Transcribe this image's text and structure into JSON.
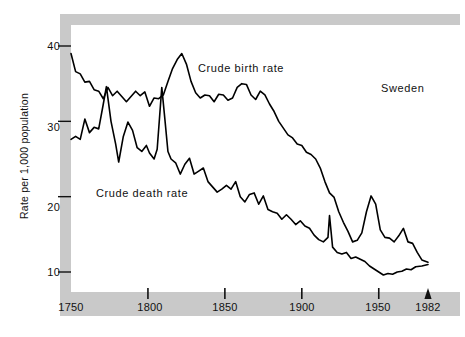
{
  "chart_data": {
    "type": "line",
    "title": "",
    "subtitle": "",
    "xlabel": "",
    "ylabel": "Rate per 1,000 population",
    "region_annotation": "Sweden",
    "xlim": [
      1750,
      1982
    ],
    "ylim": [
      8,
      42
    ],
    "grid": false,
    "legend_position": "inline-annotations",
    "x_ticks": [
      1750,
      1800,
      1850,
      1900,
      1950,
      1982
    ],
    "x_tick_labels": [
      "1750",
      "1800",
      "1850",
      "1900",
      "1950",
      "1982"
    ],
    "y_ticks": [
      10,
      20,
      30,
      40
    ],
    "y_tick_labels": [
      "10",
      "20",
      "30",
      "40"
    ],
    "end_marker": {
      "x": 1982,
      "shape": "up-arrow",
      "label": "1982"
    },
    "series": [
      {
        "name": "Crude birth rate",
        "label": "Crude birth rate",
        "color": "#000000",
        "points": [
          [
            1750,
            39.0
          ],
          [
            1753,
            36.6
          ],
          [
            1756,
            36.3
          ],
          [
            1759,
            35.2
          ],
          [
            1762,
            35.3
          ],
          [
            1765,
            34.2
          ],
          [
            1768,
            34.0
          ],
          [
            1771,
            33.0
          ],
          [
            1774,
            34.5
          ],
          [
            1777,
            33.4
          ],
          [
            1780,
            34.0
          ],
          [
            1783,
            33.3
          ],
          [
            1786,
            32.6
          ],
          [
            1789,
            33.3
          ],
          [
            1792,
            34.0
          ],
          [
            1795,
            33.4
          ],
          [
            1798,
            33.9
          ],
          [
            1801,
            32.0
          ],
          [
            1804,
            33.1
          ],
          [
            1807,
            33.0
          ],
          [
            1810,
            33.5
          ],
          [
            1813,
            35.3
          ],
          [
            1816,
            37.0
          ],
          [
            1819,
            38.2
          ],
          [
            1822,
            39.0
          ],
          [
            1825,
            37.6
          ],
          [
            1828,
            35.3
          ],
          [
            1831,
            33.8
          ],
          [
            1834,
            33.1
          ],
          [
            1837,
            33.5
          ],
          [
            1840,
            33.4
          ],
          [
            1843,
            32.6
          ],
          [
            1846,
            33.6
          ],
          [
            1849,
            33.5
          ],
          [
            1852,
            32.8
          ],
          [
            1855,
            33.1
          ],
          [
            1858,
            34.5
          ],
          [
            1861,
            35.0
          ],
          [
            1864,
            34.9
          ],
          [
            1867,
            33.5
          ],
          [
            1870,
            32.9
          ],
          [
            1873,
            34.0
          ],
          [
            1876,
            33.5
          ],
          [
            1879,
            32.3
          ],
          [
            1882,
            31.3
          ],
          [
            1885,
            30.0
          ],
          [
            1888,
            29.1
          ],
          [
            1891,
            28.2
          ],
          [
            1894,
            27.8
          ],
          [
            1897,
            27.0
          ],
          [
            1900,
            26.8
          ],
          [
            1903,
            25.9
          ],
          [
            1906,
            25.6
          ],
          [
            1909,
            25.0
          ],
          [
            1912,
            23.8
          ],
          [
            1915,
            22.0
          ],
          [
            1918,
            20.5
          ],
          [
            1921,
            19.9
          ],
          [
            1924,
            18.0
          ],
          [
            1927,
            16.6
          ],
          [
            1930,
            15.4
          ],
          [
            1933,
            14.0
          ],
          [
            1936,
            14.2
          ],
          [
            1939,
            15.2
          ],
          [
            1942,
            18.0
          ],
          [
            1945,
            20.1
          ],
          [
            1948,
            19.0
          ],
          [
            1951,
            15.6
          ],
          [
            1954,
            14.6
          ],
          [
            1957,
            14.5
          ],
          [
            1960,
            14.0
          ],
          [
            1963,
            14.8
          ],
          [
            1966,
            15.8
          ],
          [
            1969,
            14.0
          ],
          [
            1972,
            13.8
          ],
          [
            1975,
            12.6
          ],
          [
            1978,
            11.6
          ],
          [
            1982,
            11.3
          ]
        ]
      },
      {
        "name": "Crude death rate",
        "label": "Crude death rate",
        "color": "#000000",
        "points": [
          [
            1750,
            27.6
          ],
          [
            1753,
            28.0
          ],
          [
            1756,
            27.6
          ],
          [
            1759,
            30.3
          ],
          [
            1762,
            28.5
          ],
          [
            1765,
            29.2
          ],
          [
            1768,
            29.0
          ],
          [
            1771,
            32.3
          ],
          [
            1773,
            34.6
          ],
          [
            1776,
            30.0
          ],
          [
            1779,
            27.0
          ],
          [
            1781,
            24.6
          ],
          [
            1784,
            28.0
          ],
          [
            1787,
            29.9
          ],
          [
            1790,
            28.8
          ],
          [
            1793,
            26.5
          ],
          [
            1796,
            26.0
          ],
          [
            1799,
            26.8
          ],
          [
            1801,
            25.8
          ],
          [
            1804,
            25.0
          ],
          [
            1806,
            26.3
          ],
          [
            1809,
            34.5
          ],
          [
            1811,
            30.3
          ],
          [
            1813,
            26.0
          ],
          [
            1815,
            25.0
          ],
          [
            1818,
            24.5
          ],
          [
            1821,
            23.0
          ],
          [
            1824,
            24.3
          ],
          [
            1827,
            25.1
          ],
          [
            1830,
            23.0
          ],
          [
            1833,
            23.4
          ],
          [
            1836,
            23.8
          ],
          [
            1839,
            22.0
          ],
          [
            1842,
            21.3
          ],
          [
            1845,
            20.6
          ],
          [
            1848,
            21.0
          ],
          [
            1851,
            21.5
          ],
          [
            1854,
            21.0
          ],
          [
            1857,
            22.0
          ],
          [
            1860,
            20.0
          ],
          [
            1863,
            19.3
          ],
          [
            1866,
            20.3
          ],
          [
            1869,
            20.5
          ],
          [
            1872,
            19.0
          ],
          [
            1875,
            20.1
          ],
          [
            1878,
            18.3
          ],
          [
            1881,
            18.0
          ],
          [
            1884,
            17.8
          ],
          [
            1887,
            17.0
          ],
          [
            1890,
            17.6
          ],
          [
            1893,
            17.0
          ],
          [
            1896,
            16.3
          ],
          [
            1899,
            16.8
          ],
          [
            1902,
            16.1
          ],
          [
            1905,
            15.8
          ],
          [
            1908,
            14.9
          ],
          [
            1911,
            14.3
          ],
          [
            1914,
            14.0
          ],
          [
            1917,
            14.6
          ],
          [
            1918,
            17.5
          ],
          [
            1920,
            13.3
          ],
          [
            1923,
            12.6
          ],
          [
            1926,
            12.4
          ],
          [
            1929,
            12.6
          ],
          [
            1932,
            11.8
          ],
          [
            1935,
            12.0
          ],
          [
            1938,
            11.7
          ],
          [
            1941,
            11.4
          ],
          [
            1944,
            10.8
          ],
          [
            1947,
            10.4
          ],
          [
            1950,
            10.0
          ],
          [
            1953,
            9.6
          ],
          [
            1956,
            9.8
          ],
          [
            1959,
            9.7
          ],
          [
            1962,
            10.0
          ],
          [
            1965,
            10.1
          ],
          [
            1968,
            10.4
          ],
          [
            1971,
            10.3
          ],
          [
            1974,
            10.7
          ],
          [
            1978,
            10.8
          ],
          [
            1982,
            11.0
          ]
        ]
      }
    ]
  },
  "axes": {
    "y_label": "Rate per 1,000 population",
    "y_tick_labels": [
      "40",
      "30",
      "20",
      "10"
    ],
    "x_tick_labels": [
      "1750",
      "1800",
      "1850",
      "1900",
      "1950",
      "1982"
    ]
  },
  "annotations": {
    "birth": "Crude birth rate",
    "death": "Crude death rate",
    "country": "Sweden"
  },
  "colors": {
    "line": "#000000",
    "plate": "#c9c9c9",
    "plot_background": "#ffffff",
    "text": "#111111"
  }
}
